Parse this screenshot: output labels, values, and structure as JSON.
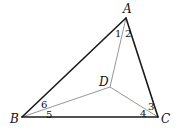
{
  "figure": {
    "vertices": {
      "A": {
        "label": "A",
        "x": 126,
        "y": 18,
        "lx": 123,
        "ly": 13
      },
      "B": {
        "label": "B",
        "x": 22,
        "y": 117,
        "lx": 10,
        "ly": 123
      },
      "C": {
        "label": "C",
        "x": 158,
        "y": 117,
        "lx": 161,
        "ly": 123
      },
      "D": {
        "label": "D",
        "x": 110,
        "y": 87,
        "lx": 99,
        "ly": 86
      }
    },
    "outer_triangle": [
      "A",
      "B",
      "C"
    ],
    "inner_segments": [
      [
        "A",
        "D"
      ],
      [
        "B",
        "D"
      ],
      [
        "C",
        "D"
      ]
    ],
    "angle_labels": [
      {
        "label": "1",
        "x": 115,
        "y": 37
      },
      {
        "label": "2",
        "x": 125,
        "y": 37
      },
      {
        "label": "6",
        "x": 41,
        "y": 108
      },
      {
        "label": "5",
        "x": 46,
        "y": 118
      },
      {
        "label": "3",
        "x": 148,
        "y": 110
      },
      {
        "label": "4",
        "x": 140,
        "y": 117
      }
    ],
    "colors": {
      "outer": "#1a1a1a",
      "inner": "#8a8a8a",
      "text": "#111111"
    }
  }
}
